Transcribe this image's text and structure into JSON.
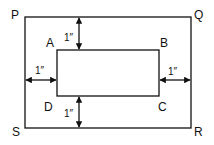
{
  "diagram": {
    "outer_rect": {
      "corners": {
        "top_left": "P",
        "top_right": "Q",
        "bottom_right": "R",
        "bottom_left": "S"
      }
    },
    "inner_rect": {
      "corners": {
        "top_left": "A",
        "top_right": "B",
        "bottom_right": "C",
        "bottom_left": "D"
      }
    },
    "margins": {
      "top": "1″",
      "bottom": "1″",
      "left": "1″",
      "right": "1″"
    },
    "colors": {
      "stroke": "#111111",
      "background": "#ffffff"
    }
  }
}
